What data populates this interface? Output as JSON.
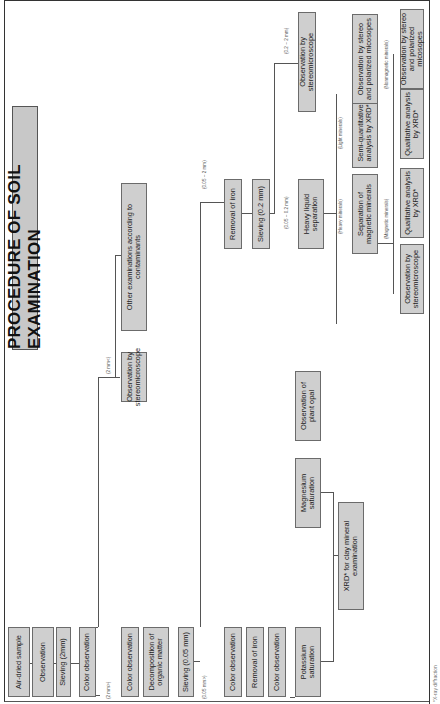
{
  "title": "PROCEDURE OF SOIL EXAMINATION",
  "footnote": "*X-ray diffraction",
  "steps": {
    "air_dried_sample": "Air-dried sample",
    "observation": "Observation",
    "sieving_2mm": "Sieving (2mm)",
    "color_observation_1": "Color observation",
    "obs_stereo_gt2": "Observation by stereomicroscope",
    "other_exams": "Other examinations according to contaminants",
    "color_observation_2": "Color observation",
    "decomposition_organic": "Decomposition of organic matter",
    "sieving_005": "Sieving (0.05 mm)",
    "color_observation_3": "Color observation",
    "removal_iron_1": "Removal of iron",
    "color_observation_4": "Color observation",
    "potassium_saturation": "Potassium saturation",
    "magnesium_saturation": "Magnesium saturation",
    "observation_plant_opal": "Observation of plant opal",
    "xrd_clay": "XRD* for clay mineral examination",
    "removal_iron_2": "Removal of iron",
    "sieving_02": "Sieving (0.2 mm)",
    "obs_stereo_02_2": "Observation by stereomicroscope",
    "heavy_liquid": "Heavy liquid separation",
    "separation_magnetic": "Separation of magnetic minerals",
    "semi_quant_xrd": "Semi-quantitative analysis by XRD*",
    "obs_stereo_polar_light": "Observation by stereo and polarized micosopes",
    "qual_xrd_magnetic": "Qualitative analysis by XRD*",
    "obs_stereo_magnetic": "Observation by stereomicroscope",
    "qual_xrd_nonmagnetic": "Qualitative analysis by XRD*",
    "obs_stereo_polar_nonmag": "Observation by stereo and polarized micosopes"
  },
  "edge_labels": {
    "gt2_a": "(2 mm<)",
    "gt2_b": "(2 mm<)",
    "lt2": "(2 mm>)",
    "lt005": "(0.05 mm>)",
    "r005_2": "(0.05 ~ 2 mm)",
    "r02_2": "(0.2 ~ 2 mm)",
    "r005_02": "(0.05 ~ 0.2 mm)",
    "light": "(Light minerals)",
    "heavy": "(Heavy minerals)",
    "magnetic": "(Magnetic minerals)",
    "nonmagnetic": "(Nonmagnetic minerals)"
  },
  "colors": {
    "box_fill": "#cfcfcf",
    "box_border": "#6b6b6b",
    "title_fill": "#c8c8c8",
    "line": "#555555"
  }
}
